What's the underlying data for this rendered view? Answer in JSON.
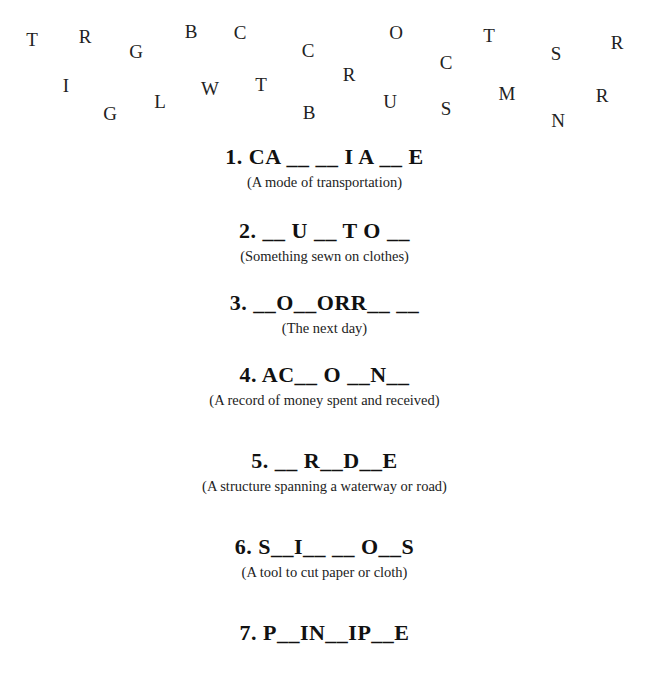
{
  "letter_bank": [
    {
      "char": "T",
      "x": 32,
      "y": 39
    },
    {
      "char": "R",
      "x": 85,
      "y": 36
    },
    {
      "char": "G",
      "x": 136,
      "y": 51
    },
    {
      "char": "B",
      "x": 191,
      "y": 31
    },
    {
      "char": "C",
      "x": 240,
      "y": 32
    },
    {
      "char": "C",
      "x": 308,
      "y": 50
    },
    {
      "char": "O",
      "x": 396,
      "y": 32
    },
    {
      "char": "T",
      "x": 489,
      "y": 35
    },
    {
      "char": "S",
      "x": 556,
      "y": 53
    },
    {
      "char": "R",
      "x": 617,
      "y": 42
    },
    {
      "char": "I",
      "x": 66,
      "y": 85
    },
    {
      "char": "G",
      "x": 110,
      "y": 113
    },
    {
      "char": "L",
      "x": 160,
      "y": 101
    },
    {
      "char": "W",
      "x": 210,
      "y": 88
    },
    {
      "char": "T",
      "x": 261,
      "y": 84
    },
    {
      "char": "B",
      "x": 309,
      "y": 112
    },
    {
      "char": "R",
      "x": 349,
      "y": 74
    },
    {
      "char": "C",
      "x": 446,
      "y": 62
    },
    {
      "char": "U",
      "x": 390,
      "y": 101
    },
    {
      "char": "S",
      "x": 446,
      "y": 108
    },
    {
      "char": "M",
      "x": 507,
      "y": 93
    },
    {
      "char": "R",
      "x": 602,
      "y": 95
    },
    {
      "char": "N",
      "x": 558,
      "y": 120
    }
  ],
  "puzzles": [
    {
      "number": "1.",
      "word": "1. CA __ __ I A __ E",
      "hint": "(A mode of transportation)"
    },
    {
      "number": "2.",
      "word": "2. __ U __ T O __",
      "hint": "(Something sewn on clothes)"
    },
    {
      "number": "3.",
      "word": "3. __O__ORR__ __",
      "hint": "(The next day)"
    },
    {
      "number": "4.",
      "word": "4. AC__ O __N__",
      "hint": "(A record of money spent and received)"
    },
    {
      "number": "5.",
      "word": "5. __ R__D__E",
      "hint": "(A structure spanning a waterway or road)"
    },
    {
      "number": "6.",
      "word": "6. S__I__ __ O__S",
      "hint": "(A tool to cut paper or cloth)"
    },
    {
      "number": "7.",
      "word": "7. P__IN__IP__E",
      "hint": ""
    }
  ]
}
